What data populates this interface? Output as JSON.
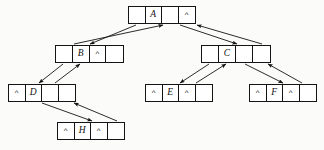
{
  "diagram": {
    "background_color": "#fbfbfa",
    "stroke_color": "#141414",
    "node_fill": "#ffffff",
    "nil_symbol": "^",
    "nodes": [
      {
        "id": "A",
        "label": "A",
        "x": 128,
        "y": 6,
        "width": 68,
        "height": 18,
        "cells": [
          "",
          "A",
          "",
          "^"
        ]
      },
      {
        "id": "B",
        "label": "B",
        "x": 55,
        "y": 45,
        "width": 69,
        "height": 18,
        "cells": [
          "",
          "B",
          "^",
          ""
        ]
      },
      {
        "id": "C",
        "label": "C",
        "x": 201,
        "y": 45,
        "width": 70,
        "height": 18,
        "cells": [
          "",
          "C",
          "",
          ""
        ]
      },
      {
        "id": "D",
        "label": "D",
        "x": 8,
        "y": 84,
        "width": 68,
        "height": 18,
        "cells": [
          "^",
          "D",
          "",
          ""
        ]
      },
      {
        "id": "E",
        "label": "E",
        "x": 145,
        "y": 84,
        "width": 68,
        "height": 18,
        "cells": [
          "^",
          "E",
          "^",
          ""
        ]
      },
      {
        "id": "F",
        "label": "F",
        "x": 249,
        "y": 84,
        "width": 68,
        "height": 18,
        "cells": [
          "^",
          "F",
          "^",
          ""
        ]
      },
      {
        "id": "H",
        "label": "H",
        "x": 57,
        "y": 122,
        "width": 68,
        "height": 18,
        "cells": [
          "^",
          "H",
          "^",
          ""
        ]
      }
    ],
    "edges": [
      {
        "id": "a-left-to-b",
        "from": "A",
        "to": "B",
        "x1": 136,
        "y1": 25,
        "x2": 90,
        "y2": 44
      },
      {
        "id": "b-parent-to-a",
        "from": "B",
        "to": "A",
        "x1": 74,
        "y1": 44,
        "x2": 163,
        "y2": 25
      },
      {
        "id": "a-right-to-c",
        "from": "A",
        "to": "C",
        "x1": 180,
        "y1": 25,
        "x2": 237,
        "y2": 44
      },
      {
        "id": "c-parent-to-a",
        "from": "C",
        "to": "A",
        "x1": 262,
        "y1": 44,
        "x2": 197,
        "y2": 25
      },
      {
        "id": "b-left-to-d",
        "from": "B",
        "to": "D",
        "x1": 63,
        "y1": 64,
        "x2": 39,
        "y2": 83
      },
      {
        "id": "d-parent-to-b",
        "from": "D",
        "to": "B",
        "x1": 55,
        "y1": 83,
        "x2": 80,
        "y2": 64
      },
      {
        "id": "d-right-to-h",
        "from": "D",
        "to": "H",
        "x1": 42,
        "y1": 103,
        "x2": 92,
        "y2": 121
      },
      {
        "id": "h-parent-to-d",
        "from": "H",
        "to": "D",
        "x1": 117,
        "y1": 121,
        "x2": 74,
        "y2": 103
      },
      {
        "id": "c-left-to-e",
        "from": "C",
        "to": "E",
        "x1": 209,
        "y1": 64,
        "x2": 180,
        "y2": 83
      },
      {
        "id": "e-parent-to-c",
        "from": "E",
        "to": "C",
        "x1": 196,
        "y1": 83,
        "x2": 226,
        "y2": 64
      },
      {
        "id": "c-right-to-f",
        "from": "C",
        "to": "F",
        "x1": 245,
        "y1": 64,
        "x2": 283,
        "y2": 83
      },
      {
        "id": "f-parent-to-c",
        "from": "F",
        "to": "C",
        "x1": 302,
        "y1": 83,
        "x2": 268,
        "y2": 64
      }
    ]
  }
}
